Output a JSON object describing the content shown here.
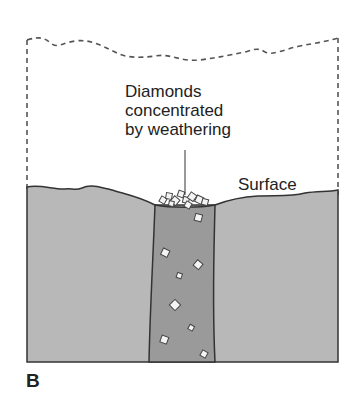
{
  "figure": {
    "panel_label": "B",
    "callout_text": [
      "Diamonds",
      "concentrated",
      "by weathering"
    ],
    "surface_label": "Surface",
    "colors": {
      "host_rock": "#b8b8b8",
      "kimberlite_pipe": "#9a9a9a",
      "diamond": "#f4f4f4",
      "outline": "#333333",
      "eroded_outline": "#555555"
    },
    "components": [
      "eroded former surface (dashed)",
      "host rock",
      "kimberlite pipe",
      "diamonds in pipe",
      "surface diamond concentration"
    ]
  }
}
